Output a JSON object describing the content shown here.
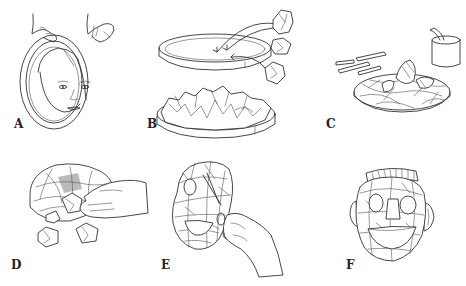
{
  "figure": {
    "background": "#ffffff",
    "line_color": "#333333",
    "panels": [
      {
        "id": "A",
        "label": "A",
        "depicts": "Hands holding an oval hoop ring around a woman's face to size the mask"
      },
      {
        "id": "B",
        "label": "B",
        "depicts": "Shallow round tray with arrows showing crumpled paper balls placed inside; below, the tray filled with crumpled paper"
      },
      {
        "id": "C",
        "label": "C",
        "depicts": "Paper strips and a pot of paste; strips layered over the paper-filled tray"
      },
      {
        "id": "D",
        "label": "D",
        "depicts": "Hand removing crumpled paper balls from underneath the dried strip shell"
      },
      {
        "id": "E",
        "label": "E",
        "depicts": "Hand cutting eye and mouth holes in the strip mask with scissors"
      },
      {
        "id": "F",
        "label": "F",
        "depicts": "Finished mask with eye holes, grinning mouth, ears, and a beaded headband"
      }
    ]
  }
}
